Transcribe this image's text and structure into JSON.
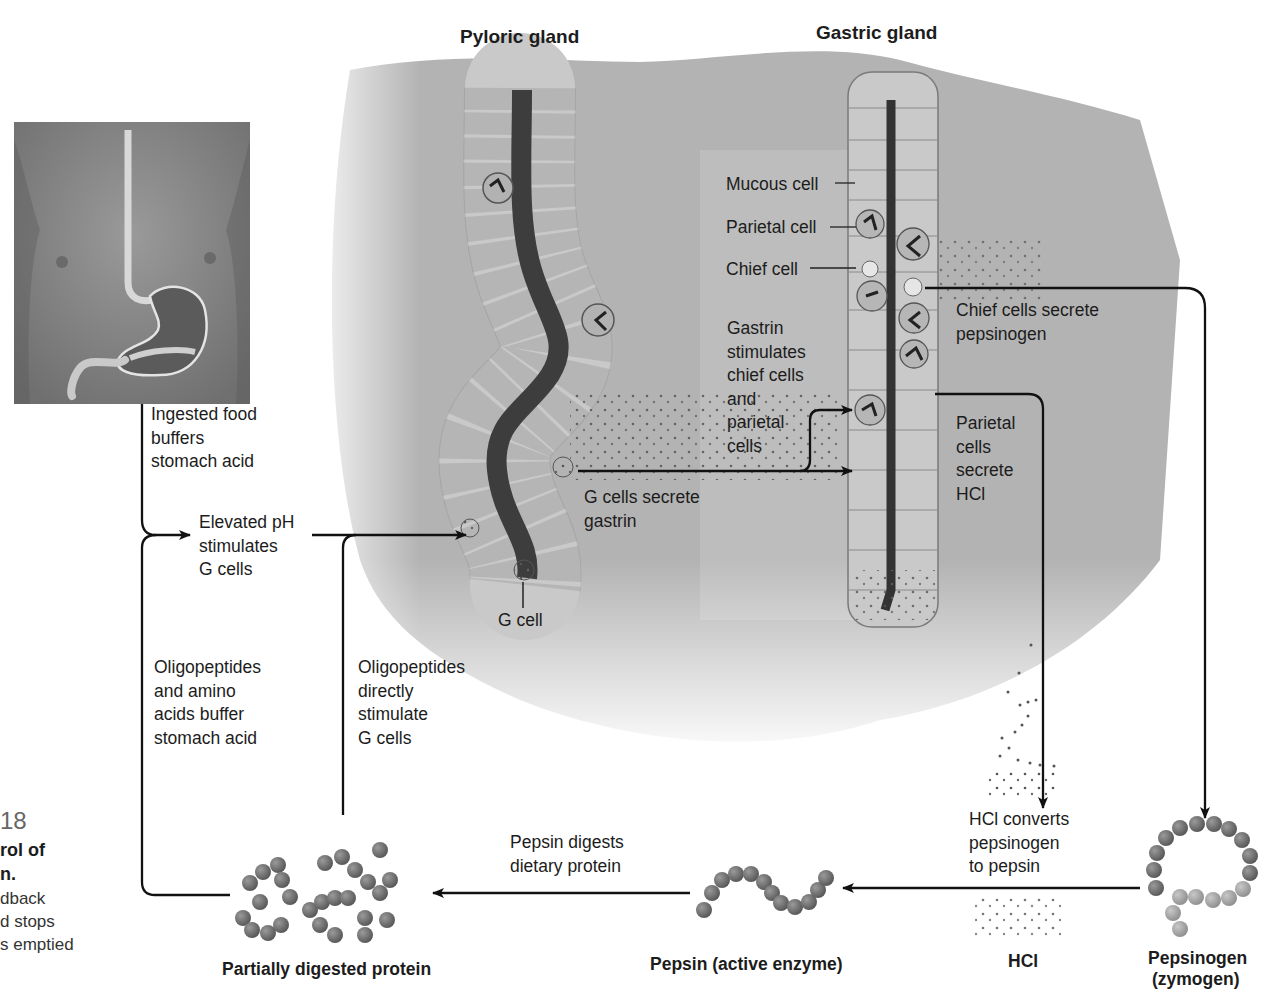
{
  "figure": {
    "caption": {
      "number": "18",
      "title_line1": "rol of",
      "title_line2": "n.",
      "body_line1": "dback",
      "body_line2": "d stops",
      "body_line3": "s emptied"
    }
  },
  "glands": {
    "pyloric": {
      "title": "Pyloric gland",
      "g_cell_label": "G cell"
    },
    "gastric": {
      "title": "Gastric gland",
      "cell_labels": {
        "mucous": "Mucous cell",
        "parietal": "Parietal cell",
        "chief": "Chief cell"
      }
    }
  },
  "steps": {
    "ingested_food": "Ingested food\nbuffers\nstomach acid",
    "elevated_ph": "Elevated pH\nstimulates\nG cells",
    "g_cells_secrete": "G cells secrete\ngastrin",
    "gastrin_stimulates": "Gastrin\nstimulates\nchief cells\nand\nparietal\ncells",
    "chief_secrete": "Chief cells secrete\npepsinogen",
    "parietal_secrete": "Parietal\ncells\nsecrete\nHCl",
    "hcl_converts": "HCl converts\npepsinogen\nto pepsin",
    "pepsin_digests": "Pepsin digests\ndietary protein",
    "oligo_buffer": "Oligopeptides\nand amino\nacids buffer\nstomach acid",
    "oligo_direct": "Oligopeptides\ndirectly\nstimulate\nG cells"
  },
  "molecules": {
    "partially_digested": "Partially digested protein",
    "pepsin": "Pepsin (active enzyme)",
    "hcl": "HCl",
    "pepsinogen_line1": "Pepsinogen",
    "pepsinogen_line2": "(zymogen)"
  },
  "colors": {
    "tissue": "#a9a9a9",
    "tissue_light": "#d6d6d6",
    "lumen": "#3f3f3f",
    "cell_fill": "#d8d8d8",
    "cell_stroke": "#6a6a6a",
    "arrow": "#111111",
    "bead_dark": "#6e6e6e",
    "bead_light": "#a5a5a5"
  }
}
